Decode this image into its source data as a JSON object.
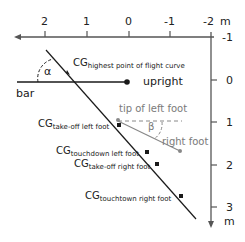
{
  "diagram": {
    "x_axis": {
      "ticks": [
        "2",
        "1",
        "0",
        "-1",
        "-2"
      ],
      "unit": "m",
      "direction": "left"
    },
    "y_axis": {
      "ticks": [
        "-1",
        "0",
        "1",
        "2",
        "3"
      ],
      "unit": "m",
      "direction": "down"
    },
    "labels": {
      "alpha": "α",
      "beta": "β",
      "bar": "bar",
      "upright": "upright",
      "tip_left_foot": "tip of left foot",
      "right_foot": "right foot",
      "cg_prefix": "CG",
      "cg_highest": "highest point of flight curve",
      "cg_takeoff_left": "take-off left foot",
      "cg_touchdown_left": "touchdown left foot",
      "cg_takeoff_right": "take-off right foot",
      "cg_touchdown_right": "touchtown right foot"
    },
    "colors": {
      "line": "#1a1a1a",
      "axis": "#555555",
      "foot_line": "#888888"
    }
  }
}
